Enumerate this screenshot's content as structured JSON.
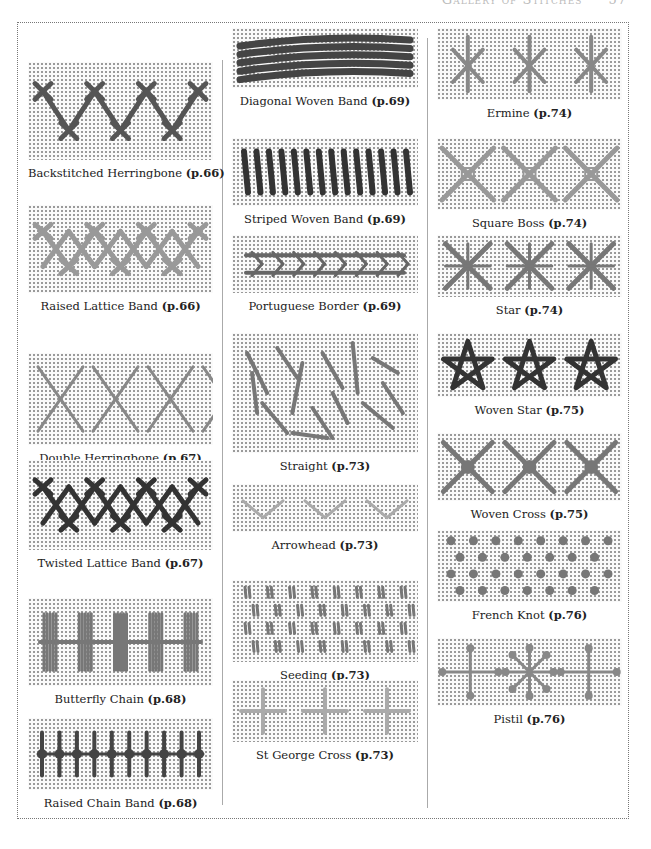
{
  "header": {
    "title": "Gallery of Stitches",
    "page": "57"
  },
  "columns": [
    {
      "items": [
        {
          "name": "Backstitched Herringbone",
          "page": "(p.66)",
          "motif": "herringbone-backstitched",
          "shade": "#555"
        },
        {
          "name": "Raised Lattice Band",
          "page": "(p.66)",
          "motif": "raised-lattice",
          "shade": "#999"
        },
        {
          "name": "Double Herringbone",
          "page": "(p.67)",
          "motif": "double-herringbone",
          "shade": "#888"
        },
        {
          "name": "Twisted Lattice Band",
          "page": "(p.67)",
          "motif": "twisted-lattice",
          "shade": "#333"
        },
        {
          "name": "Butterfly Chain",
          "page": "(p.68)",
          "motif": "butterfly-chain",
          "shade": "#777"
        },
        {
          "name": "Raised Chain Band",
          "page": "(p.68)",
          "motif": "raised-chain",
          "shade": "#444"
        }
      ]
    },
    {
      "items": [
        {
          "name": "Diagonal Woven Band",
          "page": "(p.69)",
          "motif": "diagonal-woven",
          "shade": "#444"
        },
        {
          "name": "Striped Woven Band",
          "page": "(p.69)",
          "motif": "striped-woven",
          "shade": "#333"
        },
        {
          "name": "Portuguese Border",
          "page": "(p.69)",
          "motif": "portuguese-border",
          "shade": "#666"
        },
        {
          "name": "Straight",
          "page": "(p.73)",
          "motif": "straight",
          "shade": "#777"
        },
        {
          "name": "Arrowhead",
          "page": "(p.73)",
          "motif": "arrowhead",
          "shade": "#aaa"
        },
        {
          "name": "Seeding",
          "page": "(p.73)",
          "motif": "seeding",
          "shade": "#777"
        },
        {
          "name": "St George Cross",
          "page": "(p.73)",
          "motif": "st-george-cross",
          "shade": "#aaa"
        }
      ]
    },
    {
      "items": [
        {
          "name": "Ermine",
          "page": "(p.74)",
          "motif": "ermine",
          "shade": "#888"
        },
        {
          "name": "Square Boss",
          "page": "(p.74)",
          "motif": "square-boss",
          "shade": "#999"
        },
        {
          "name": "Star",
          "page": "(p.74)",
          "motif": "star",
          "shade": "#777"
        },
        {
          "name": "Woven Star",
          "page": "(p.75)",
          "motif": "woven-star",
          "shade": "#333"
        },
        {
          "name": "Woven Cross",
          "page": "(p.75)",
          "motif": "woven-cross",
          "shade": "#777"
        },
        {
          "name": "French Knot",
          "page": "(p.76)",
          "motif": "french-knot",
          "shade": "#777"
        },
        {
          "name": "Pistil",
          "page": "(p.76)",
          "motif": "pistil",
          "shade": "#888"
        }
      ]
    }
  ]
}
